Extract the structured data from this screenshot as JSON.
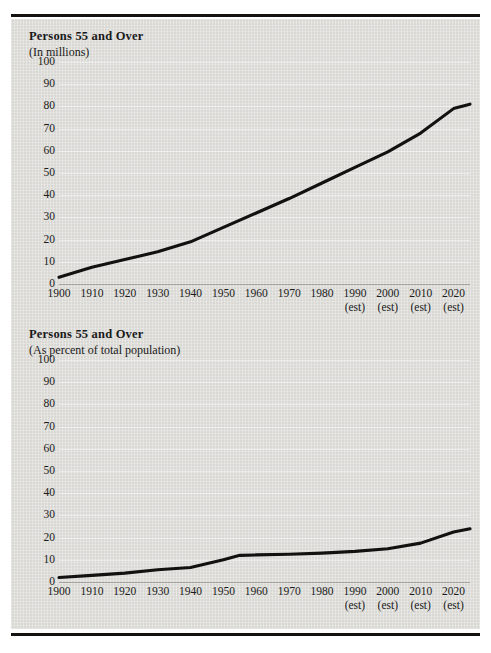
{
  "page": {
    "background_color": "#ffffff",
    "panel_color": "#d9d8d4",
    "line_color": "#121110"
  },
  "charts": [
    {
      "title": "Persons 55 and Over",
      "subtitle": "(In millions)"
    },
    {
      "title": "Persons 55 and Over",
      "subtitle": "(As percent of total population)"
    }
  ],
  "chart_data": [
    {
      "type": "line",
      "title": "Persons 55 and Over",
      "subtitle": "(In millions)",
      "xlabel": "",
      "ylabel": "",
      "ylim": [
        0,
        100
      ],
      "xlim": [
        1900,
        2025
      ],
      "yticks": [
        0,
        10,
        20,
        30,
        40,
        50,
        60,
        70,
        80,
        90,
        100
      ],
      "grid": true,
      "legend": false,
      "x": [
        1900,
        1910,
        1920,
        1930,
        1940,
        1950,
        1960,
        1970,
        1980,
        1990,
        2000,
        2010,
        2020,
        2025
      ],
      "xtick_labels": [
        "1900",
        "1910",
        "1920",
        "1930",
        "1940",
        "1950",
        "1960",
        "1970",
        "1980",
        "1990",
        "2000",
        "2010",
        "2020"
      ],
      "xtick_notes": [
        "",
        "",
        "",
        "",
        "",
        "",
        "",
        "",
        "",
        "(est)",
        "(est)",
        "(est)",
        "(est)"
      ],
      "values": [
        3,
        7.5,
        11,
        14.5,
        19,
        25.5,
        32,
        38.5,
        45.5,
        52.5,
        59.5,
        68,
        79,
        81
      ]
    },
    {
      "type": "line",
      "title": "Persons 55 and Over",
      "subtitle": "(As percent of total population)",
      "xlabel": "",
      "ylabel": "",
      "ylim": [
        0,
        100
      ],
      "xlim": [
        1900,
        2025
      ],
      "yticks": [
        0,
        10,
        20,
        30,
        40,
        50,
        60,
        70,
        80,
        90,
        100
      ],
      "grid": true,
      "legend": false,
      "x": [
        1900,
        1910,
        1920,
        1930,
        1940,
        1950,
        1955,
        1960,
        1970,
        1980,
        1990,
        2000,
        2010,
        2020,
        2025
      ],
      "xtick_labels": [
        "1900",
        "1910",
        "1920",
        "1930",
        "1940",
        "1950",
        "1960",
        "1970",
        "1980",
        "1990",
        "2000",
        "2010",
        "2020"
      ],
      "xtick_notes": [
        "",
        "",
        "",
        "",
        "",
        "",
        "",
        "",
        "",
        "(est)",
        "(est)",
        "(est)",
        "(est)"
      ],
      "values": [
        2,
        3,
        4,
        5.5,
        6.5,
        10,
        12,
        12.2,
        12.5,
        13,
        13.8,
        15,
        17.5,
        22.5,
        24
      ]
    }
  ]
}
